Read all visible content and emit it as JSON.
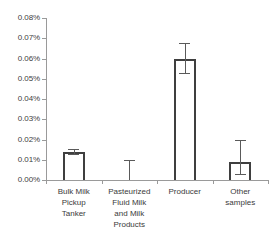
{
  "chart_data": {
    "type": "bar",
    "title": "",
    "xlabel": "",
    "ylabel": "",
    "ylim": [
      0,
      0.0008
    ],
    "grid": false,
    "legend": null,
    "y_tick_labels": [
      "0.08%",
      "0.07%",
      "0.06%",
      "0.05%",
      "0.04%",
      "0.03%",
      "0.02%",
      "0.01%",
      "0.00%"
    ],
    "y_tick_values": [
      0.08,
      0.07,
      0.06,
      0.05,
      0.04,
      0.03,
      0.02,
      0.01,
      0.0
    ],
    "y_unit": "percent",
    "categories": [
      "Bulk Milk\nPickup\nTanker",
      "Pasteurized\nFluid Milk\nand Milk\nProducts",
      "Producer",
      "Other\nsamples"
    ],
    "values": [
      0.014,
      0.0,
      0.06,
      0.009
    ],
    "error_upper": [
      0.0155,
      0.0098,
      0.0675,
      0.02
    ],
    "error_lower": [
      0.0127,
      0.0,
      0.053,
      0.003
    ],
    "bar_fill_color": "#ffffff",
    "bar_border_color": "#3f3f3f",
    "error_bar_color": "#5a5a5a",
    "axis_color": "#9a9a9a",
    "text_color": "#3a3a3a"
  }
}
